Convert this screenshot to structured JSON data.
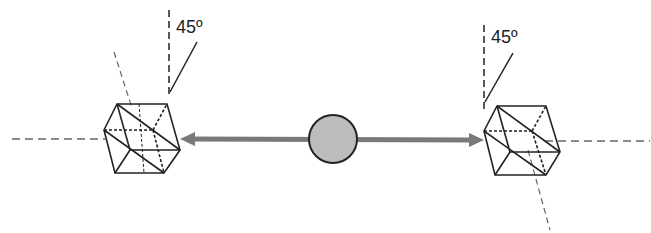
{
  "diagram": {
    "left_angle_label": "45º",
    "right_angle_label": "45º",
    "colors": {
      "line": "#222222",
      "arrow": "#7a7a7a",
      "center_fill": "#bdbdbd",
      "dashed": "#555555"
    },
    "elements": [
      "left-crystal-cube",
      "right-crystal-cube",
      "center-sphere",
      "double-arrow",
      "optical-axis-dashed"
    ]
  }
}
